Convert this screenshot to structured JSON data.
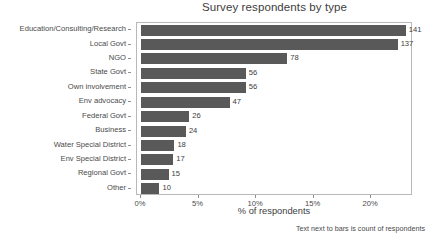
{
  "chart_data": {
    "type": "bar",
    "orientation": "horizontal",
    "title": "Survey respondents by type",
    "xlabel": "% of respondents",
    "ylabel": "",
    "footnote": "Text next to bars is count of respondents",
    "grid": false,
    "legend": null,
    "xlim": [
      0,
      23.2
    ],
    "xticks": [
      0,
      5,
      10,
      15,
      20
    ],
    "xtick_labels": [
      "0%",
      "5%",
      "10%",
      "15%",
      "20%"
    ],
    "bar_color": "#595959",
    "categories": [
      "Education/Consulting/Research",
      "Local Govt",
      "NGO",
      "State Govt",
      "Own involvement",
      "Env advocacy",
      "Federal Govt",
      "Business",
      "Water Special District",
      "Env Special District",
      "Regional Govt",
      "Other"
    ],
    "counts": [
      141,
      137,
      78,
      56,
      56,
      47,
      26,
      24,
      18,
      17,
      15,
      10
    ],
    "count_labels": [
      "141",
      "137",
      "78",
      "56",
      "56",
      "47",
      "26",
      "24",
      "18",
      "17",
      "15",
      "10"
    ],
    "values": [
      23.0,
      22.3,
      12.7,
      9.1,
      9.1,
      7.7,
      4.2,
      3.9,
      2.9,
      2.8,
      2.4,
      1.6
    ]
  }
}
